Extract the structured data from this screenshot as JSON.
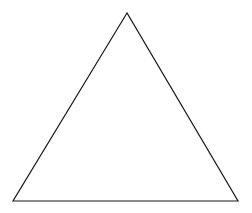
{
  "diagram": {
    "shape": "triangle",
    "type": "equilateral-triangle-outline",
    "background": "#ffffff",
    "stroke_color": "#1a1a1a",
    "stroke_width": 1.2,
    "vertices": {
      "apex": {
        "x": 127,
        "y": 13
      },
      "bottom_left": {
        "x": 13,
        "y": 201
      },
      "bottom_right": {
        "x": 238,
        "y": 201
      }
    },
    "points": "127,13 13,201 238,201"
  }
}
